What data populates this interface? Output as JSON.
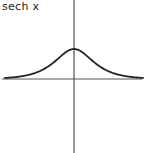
{
  "chart_data": {
    "type": "line",
    "title": "sech x",
    "xlabel": "",
    "ylabel": "",
    "function": "sech(x)",
    "series": [
      {
        "name": "sech x",
        "x": [
          -4,
          -3,
          -2,
          -1.5,
          -1,
          -0.5,
          0,
          0.5,
          1,
          1.5,
          2,
          3,
          4
        ],
        "values": [
          0.037,
          0.099,
          0.266,
          0.425,
          0.648,
          0.887,
          1.0,
          0.887,
          0.648,
          0.425,
          0.266,
          0.099,
          0.037
        ]
      }
    ],
    "xlim": [
      -4.2,
      4.2
    ],
    "ylim": [
      -4.5,
      2.8
    ],
    "grid": false,
    "legend": "none",
    "colors": {
      "curve": "#222222",
      "axes": "#555555"
    }
  }
}
